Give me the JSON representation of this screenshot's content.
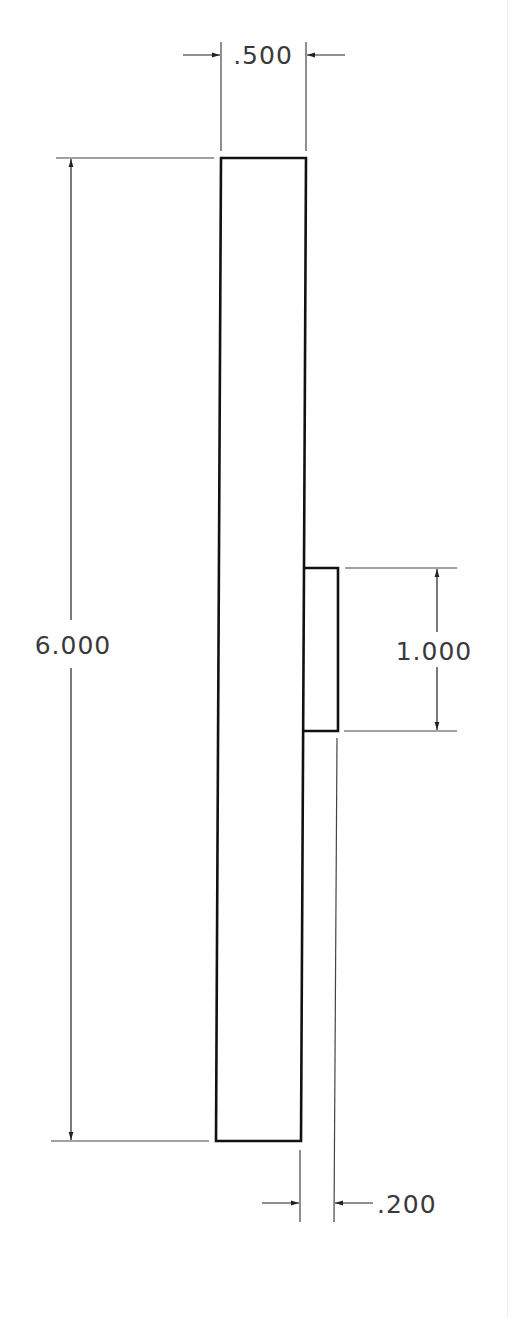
{
  "drawing": {
    "type": "orthographic technical drawing",
    "colors": {
      "background": "#ffffff",
      "object_line": "#111111",
      "dimension_line": "#444444",
      "text": "#3a3a3a"
    },
    "parts": {
      "main_body": {
        "label": "main bar",
        "width_in": 0.5,
        "height_in": 6.0
      },
      "tab": {
        "label": "side tab",
        "width_in": 0.2,
        "height_in": 1.0
      }
    },
    "dimensions": {
      "width_top": {
        "label": ".500",
        "value": 0.5,
        "orientation": "horizontal"
      },
      "overall_height": {
        "label": "6.000",
        "value": 6.0,
        "orientation": "vertical"
      },
      "tab_height": {
        "label": "1.000",
        "value": 1.0,
        "orientation": "vertical"
      },
      "tab_depth": {
        "label": ".200",
        "value": 0.2,
        "orientation": "horizontal"
      }
    }
  }
}
